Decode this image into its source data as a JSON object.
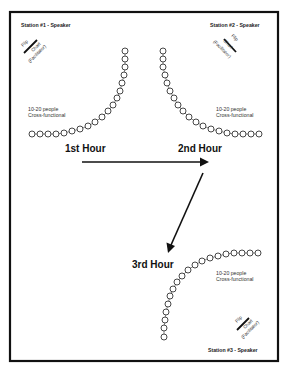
{
  "diagram": {
    "type": "room-rotation-layout",
    "stations": [
      {
        "id": 1,
        "title": "Station #1 - Speaker",
        "flip_chart": {
          "line1": "Flip",
          "line2": "Chart",
          "line3": "(Facilitator)"
        },
        "group_note": {
          "line1": "10-20 people",
          "line2": "Cross-functional"
        }
      },
      {
        "id": 2,
        "title": "Station #2 - Speaker",
        "flip_chart": {
          "line1": "Flip",
          "line2": "Chart",
          "line3": "(Facilitator)"
        },
        "group_note": {
          "line1": "10-20 people",
          "line2": "Cross-functional"
        }
      },
      {
        "id": 3,
        "title": "Station #3 - Speaker",
        "flip_chart": {
          "line1": "Flip",
          "line2": "Chart",
          "line3": "(Facilitator)"
        },
        "group_note": {
          "line1": "10-20 people",
          "line2": "Cross-functional"
        }
      }
    ],
    "hours": [
      {
        "label": "1st Hour"
      },
      {
        "label": "2nd Hour"
      },
      {
        "label": "3rd Hour"
      }
    ],
    "flow": [
      {
        "from": "1st Hour",
        "to": "2nd Hour"
      },
      {
        "from": "2nd Hour",
        "to": "3rd Hour"
      }
    ],
    "colors": {
      "line": "#111111",
      "background": "#ffffff"
    }
  }
}
